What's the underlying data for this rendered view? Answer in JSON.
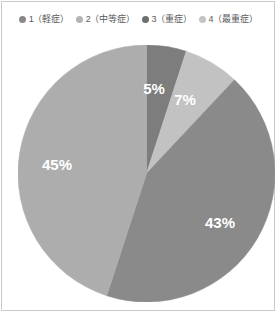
{
  "frame": {
    "border_color": "#c9c9c9",
    "background": "#ffffff"
  },
  "legend": {
    "position": "top",
    "items": [
      {
        "label": "1（軽症）",
        "color": "#888888"
      },
      {
        "label": "2（中等症）",
        "color": "#b4b4b4"
      },
      {
        "label": "3（重症）",
        "color": "#6e6e6e"
      },
      {
        "label": "4（最重症）",
        "color": "#c4c4c4"
      }
    ]
  },
  "chart_data": {
    "type": "pie",
    "title": "",
    "xlabel": "",
    "ylabel": "",
    "start_angle": 0,
    "direction": "clockwise",
    "legend_position": "top",
    "grid": false,
    "categories": [
      "1（軽症）",
      "2（中等症）",
      "3（重症）",
      "4（最重症）"
    ],
    "values": [
      5,
      7,
      43,
      45
    ],
    "labels": [
      "5%",
      "7%",
      "43%",
      "45%"
    ],
    "colors": [
      "#7d7d7d",
      "#c2c2c2",
      "#8a8a8a",
      "#adadad"
    ],
    "slices": [
      {
        "category": "1（軽症）",
        "value": 5,
        "label": "5%",
        "color": "#7d7d7d",
        "label_x": 136,
        "label_y": 45
      },
      {
        "category": "2（中等症）",
        "value": 7,
        "label": "7%",
        "color": "#c2c2c2",
        "label_x": 167,
        "label_y": 56
      },
      {
        "category": "3（重症）",
        "value": 43,
        "label": "43%",
        "color": "#8a8a8a",
        "label_x": 202,
        "label_y": 179
      },
      {
        "category": "4（最重症）",
        "value": 45,
        "label": "45%",
        "color": "#adadad",
        "label_x": 39,
        "label_y": 121
      }
    ]
  }
}
